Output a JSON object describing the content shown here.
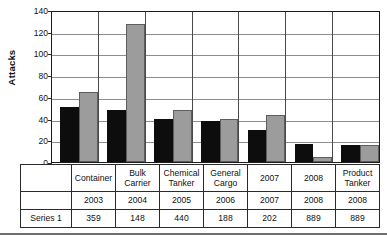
{
  "chart_data": {
    "type": "bar",
    "title": "",
    "xlabel": "",
    "ylabel": "Attacks",
    "ylim": [
      0,
      140
    ],
    "yticks": [
      0,
      20,
      40,
      60,
      80,
      100,
      120,
      140
    ],
    "grid": true,
    "legend": false,
    "categories": [
      "Container",
      "Bulk Carrier",
      "Chemical Tanker",
      "General Cargo",
      "2007",
      "2008",
      "Product Tanker"
    ],
    "series": [
      {
        "name": "Series 1",
        "color": "#0d0d0d",
        "values": [
          51,
          49,
          40,
          38,
          30,
          17,
          16
        ]
      },
      {
        "name": "Series 2",
        "color": "#9c9c9c",
        "values": [
          65,
          129,
          49,
          40,
          44,
          5,
          16
        ]
      }
    ]
  },
  "axis": {
    "y_label": "Attacks",
    "tick_140": "140",
    "tick_120": "120",
    "tick_100": "100",
    "tick_80": "80",
    "tick_60": "60",
    "tick_40": "40",
    "tick_20": "20",
    "tick_0": "0"
  },
  "table": {
    "row_head_blank": "",
    "row_head_series": "Series 1",
    "categories": [
      "Container",
      "Bulk Carrier",
      "Chemical Tanker",
      "General Cargo",
      "2007",
      "2008",
      "Product Tanker"
    ],
    "years": [
      "2003",
      "2004",
      "2005",
      "2006",
      "2007",
      "2008",
      "2008"
    ],
    "series1": [
      "359",
      "148",
      "440",
      "188",
      "202",
      "889",
      "889"
    ]
  }
}
